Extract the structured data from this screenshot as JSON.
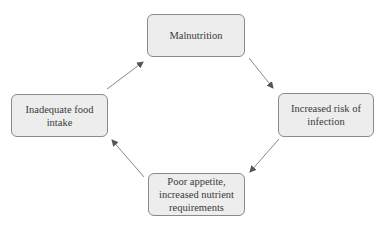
{
  "diagram": {
    "type": "cycle",
    "nodes": [
      {
        "id": "top",
        "label": "Malnutrition"
      },
      {
        "id": "right",
        "label": "Increased risk of\ninfection"
      },
      {
        "id": "bottom",
        "label": "Poor appetite,\nincreased nutrient\nrequirements"
      },
      {
        "id": "left",
        "label": "Inadequate food\nintake"
      }
    ],
    "edges": [
      {
        "from": "top",
        "to": "right"
      },
      {
        "from": "right",
        "to": "bottom"
      },
      {
        "from": "bottom",
        "to": "left"
      },
      {
        "from": "left",
        "to": "top"
      }
    ],
    "colors": {
      "node_fill": "#ededed",
      "node_border": "#8a8a8a",
      "arrow": "#6e6e6e",
      "text": "#3a3a3a"
    }
  }
}
